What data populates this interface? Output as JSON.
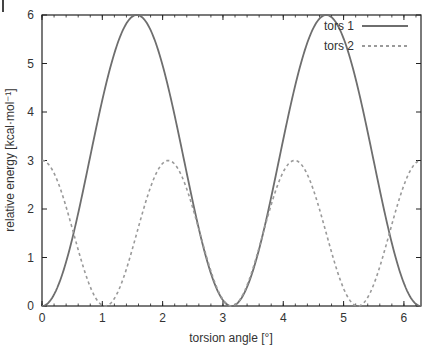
{
  "chart_data": {
    "type": "line",
    "title": "",
    "xlabel": "torsion angle [°]",
    "ylabel": "relative energy [kcal·mol⁻¹]",
    "xlim": [
      0,
      6.2832
    ],
    "ylim": [
      0,
      6
    ],
    "xticks": [
      0,
      1,
      2,
      3,
      4,
      5,
      6
    ],
    "yticks": [
      0,
      1,
      2,
      3,
      4,
      5,
      6
    ],
    "grid": false,
    "legend_position": "top-right",
    "series": [
      {
        "name": "tors 1",
        "style": "solid",
        "color": "#777777",
        "formula": "3*(1-cos(2x))",
        "x": [
          0,
          0.785,
          1.571,
          2.356,
          3.142,
          3.927,
          4.712,
          5.498,
          6.283
        ],
        "values": [
          0,
          3,
          6,
          3,
          0,
          3,
          6,
          3,
          0
        ]
      },
      {
        "name": "tors 2",
        "style": "dashed",
        "color": "#999999",
        "formula": "1.5*(1+cos(3x))",
        "x": [
          0,
          0.524,
          1.047,
          1.571,
          2.094,
          2.618,
          3.142,
          3.665,
          4.189,
          4.712,
          5.236,
          5.76,
          6.283
        ],
        "values": [
          3,
          1.5,
          0,
          1.5,
          3,
          1.5,
          0,
          1.5,
          3,
          1.5,
          0,
          1.5,
          3
        ]
      }
    ]
  },
  "colors": {
    "axis": "#222222",
    "tors1": "#6e6e6e",
    "tors2": "#9a9a9a"
  }
}
